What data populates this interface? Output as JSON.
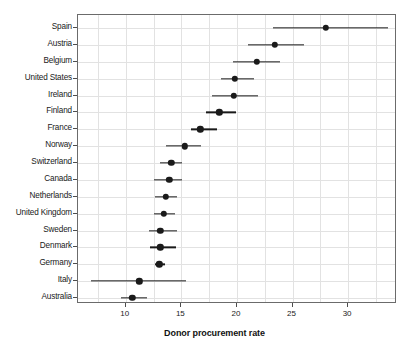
{
  "chart_data": {
    "type": "scatter",
    "subtype": "dot-plot-with-confidence-intervals",
    "title": "",
    "xlabel": "Donor procurement rate",
    "ylabel": "",
    "xlim": [
      5.7,
      34.4
    ],
    "xticks": [
      10,
      15,
      20,
      25,
      30
    ],
    "xtick_labels": [
      "10",
      "15",
      "20",
      "25",
      "30"
    ],
    "minor_gridline_step": 2.5,
    "grid": true,
    "legend": "none",
    "orientation": "horizontal",
    "categories": [
      "Spain",
      "Austria",
      "Belgium",
      "United States",
      "Ireland",
      "Finland",
      "France",
      "Norway",
      "Switzerland",
      "Canada",
      "Netherlands",
      "United Kingdom",
      "Sweden",
      "Denmark",
      "Germany",
      "Italy",
      "Australia"
    ],
    "values": [
      28.0,
      23.4,
      21.8,
      19.8,
      19.7,
      18.4,
      16.7,
      15.3,
      14.1,
      13.9,
      13.6,
      13.4,
      13.1,
      13.1,
      13.0,
      11.2,
      10.6
    ],
    "ci_low": [
      23.2,
      21.0,
      19.6,
      18.6,
      17.8,
      17.2,
      15.9,
      13.6,
      13.1,
      12.5,
      12.6,
      12.5,
      12.1,
      12.2,
      12.6,
      6.9,
      9.6
    ],
    "ci_high": [
      33.6,
      26.0,
      23.9,
      21.5,
      21.9,
      19.9,
      18.2,
      16.8,
      15.1,
      15.1,
      14.6,
      14.4,
      14.6,
      14.5,
      13.5,
      15.4,
      11.9
    ],
    "series": [
      {
        "name": "Donor procurement rate",
        "point_color": "#1a1a1a",
        "line_color": "#1a1a1a"
      }
    ]
  },
  "colors": {
    "background": "#ffffff",
    "plot_border": "#6b6b6b",
    "gridline": "#e2e2e2",
    "marker": "#1a1a1a",
    "text": "#1a1a1a"
  }
}
